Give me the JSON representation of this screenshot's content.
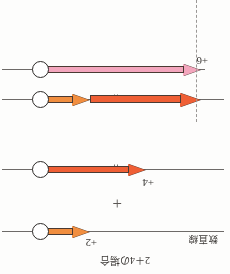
{
  "figure": {
    "caption": "2＋4の場合",
    "axis_label": "数直線",
    "operators": {
      "equals_upper": "=",
      "equals_lower": "=",
      "plus": "+"
    },
    "colors": {
      "pink_arrow": "#f3a6bd",
      "red_arrow": "#ef5f35",
      "orange_arrow": "#f18e3f",
      "number_line": "#6d6a68",
      "dashed_guide": "#9a9795",
      "marker_outline": "#2e2b29",
      "marker_fill": "#ffffff",
      "text": "#3a3734",
      "background": "#fdfdfc"
    },
    "rows": [
      {
        "id": "result",
        "value_label": "+6",
        "arrows": [
          {
            "name": "result-arrow",
            "color_key": "pink_arrow",
            "magnitude": 6,
            "direction": "left"
          }
        ],
        "has_dashed_guide": true,
        "has_circle_marker": true
      },
      {
        "id": "combined",
        "value_label": "",
        "arrows": [
          {
            "name": "four-arrow",
            "color_key": "red_arrow",
            "magnitude": 4,
            "direction": "left"
          },
          {
            "name": "two-arrow",
            "color_key": "orange_arrow",
            "magnitude": 2,
            "direction": "left"
          }
        ],
        "has_dashed_guide": true,
        "has_circle_marker": true
      },
      {
        "id": "addend-four",
        "value_label": "+4",
        "arrows": [
          {
            "name": "four-arrow",
            "color_key": "red_arrow",
            "magnitude": 4,
            "direction": "left"
          }
        ],
        "has_dashed_guide": false,
        "has_circle_marker": true
      },
      {
        "id": "addend-two",
        "value_label": "+2",
        "arrows": [
          {
            "name": "two-arrow",
            "color_key": "orange_arrow",
            "magnitude": 2,
            "direction": "left"
          }
        ],
        "has_dashed_guide": false,
        "has_circle_marker": true
      }
    ]
  }
}
